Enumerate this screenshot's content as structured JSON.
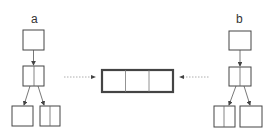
{
  "diagram": {
    "left_tree": {
      "label": "a",
      "nodes": [
        {
          "id": "a-root",
          "cells": 1
        },
        {
          "id": "a-mid",
          "cells": 2
        },
        {
          "id": "a-leaf-left",
          "cells": 1
        },
        {
          "id": "a-leaf-right",
          "cells": 2
        }
      ]
    },
    "right_tree": {
      "label": "b",
      "nodes": [
        {
          "id": "b-root",
          "cells": 1
        },
        {
          "id": "b-mid",
          "cells": 2
        },
        {
          "id": "b-leaf-left",
          "cells": 2
        },
        {
          "id": "b-leaf-right",
          "cells": 1
        }
      ]
    },
    "center_node": {
      "cells": 3,
      "border": "thick"
    },
    "connections": [
      {
        "from": "a-tree",
        "to": "center_node",
        "style": "dotted",
        "direction": "right"
      },
      {
        "from": "b-tree",
        "to": "center_node",
        "style": "dotted",
        "direction": "left"
      }
    ],
    "colors": {
      "stroke": "#444444",
      "dotted": "#888888",
      "background": "#ffffff"
    }
  }
}
